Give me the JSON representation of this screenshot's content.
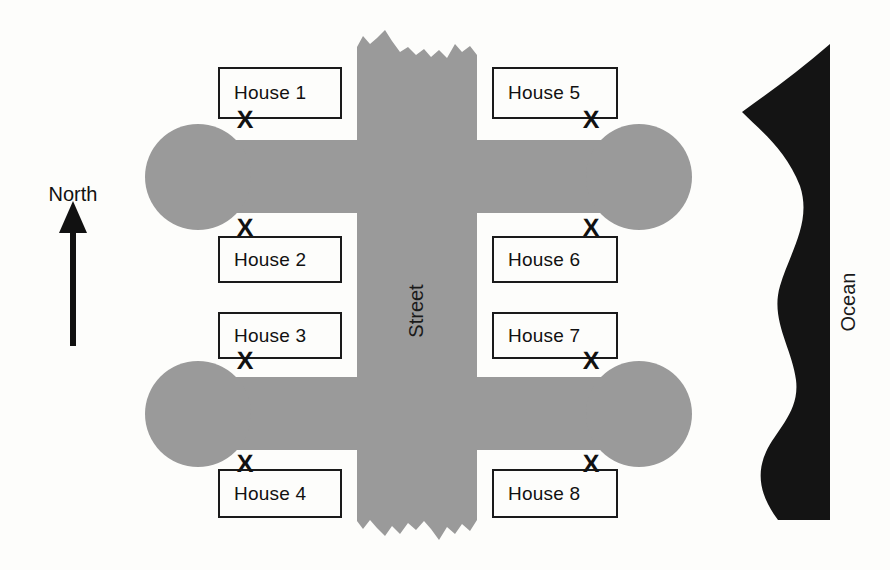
{
  "diagram": {
    "colors": {
      "street_gray": "#9a9a9a",
      "ocean_black": "#141414",
      "outline": "#1a1a1a",
      "paper": "#fdfdfb"
    },
    "compass": {
      "label": "North",
      "direction": "up"
    },
    "street": {
      "label": "Street",
      "orientation": "vertical"
    },
    "ocean": {
      "label": "Ocean",
      "side": "east"
    },
    "driveway_marker": "X",
    "houses": [
      {
        "label": "House 1",
        "x": 218,
        "y": 67,
        "w": 124,
        "h": 52,
        "mark_x": 245,
        "mark_y": 120,
        "mark_corner": "bottom-left"
      },
      {
        "label": "House 2",
        "x": 218,
        "y": 236,
        "w": 124,
        "h": 47,
        "mark_x": 245,
        "mark_y": 228,
        "mark_corner": "top-left"
      },
      {
        "label": "House 3",
        "x": 218,
        "y": 312,
        "w": 124,
        "h": 47,
        "mark_x": 245,
        "mark_y": 361,
        "mark_corner": "bottom-left"
      },
      {
        "label": "House 4",
        "x": 218,
        "y": 469,
        "w": 124,
        "h": 49,
        "mark_x": 245,
        "mark_y": 464,
        "mark_corner": "top-left"
      },
      {
        "label": "House 5",
        "x": 492,
        "y": 67,
        "w": 126,
        "h": 52,
        "mark_x": 591,
        "mark_y": 120,
        "mark_corner": "bottom-right"
      },
      {
        "label": "House 6",
        "x": 492,
        "y": 236,
        "w": 126,
        "h": 47,
        "mark_x": 591,
        "mark_y": 228,
        "mark_corner": "top-right"
      },
      {
        "label": "House 7",
        "x": 492,
        "y": 312,
        "w": 126,
        "h": 47,
        "mark_x": 591,
        "mark_y": 361,
        "mark_corner": "bottom-right"
      },
      {
        "label": "House 8",
        "x": 492,
        "y": 469,
        "w": 126,
        "h": 49,
        "mark_x": 591,
        "mark_y": 464,
        "mark_corner": "top-right"
      }
    ]
  }
}
